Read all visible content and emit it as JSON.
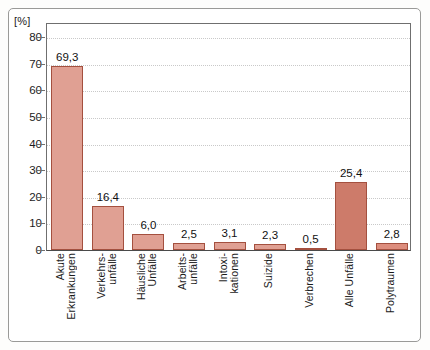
{
  "figure": {
    "y_unit_label": "[%]"
  },
  "chart_data": {
    "type": "bar",
    "title": "",
    "xlabel": "",
    "ylabel": "[%]",
    "ylim": [
      0,
      85
    ],
    "yticks": [
      0,
      10,
      20,
      30,
      40,
      50,
      60,
      70,
      80
    ],
    "ytick_labels": [
      "0",
      "10",
      "20",
      "30",
      "40",
      "50",
      "60",
      "70",
      "80"
    ],
    "grid": "horizontal-dotted",
    "legend": "none",
    "categories": [
      "Akute Erkrankungen",
      "Verkehrs-unfälle",
      "Häusliche Unfälle",
      "Arbeits-unfälle",
      "Intoxi-kationen",
      "Suizide",
      "Verbrechen",
      "Alle Unfälle",
      "Polytraumen"
    ],
    "category_lines": [
      [
        "Akute",
        "Erkrankungen"
      ],
      [
        "Verkehrs-",
        "unfälle"
      ],
      [
        "Häusliche",
        "Unfälle"
      ],
      [
        "Arbeits-",
        "unfälle"
      ],
      [
        "Intoxi-",
        "kationen"
      ],
      [
        "Suizide"
      ],
      [
        "Verbrechen"
      ],
      [
        "Alle Unfälle"
      ],
      [
        "Polytraumen"
      ]
    ],
    "values": [
      69.3,
      16.4,
      6.0,
      2.5,
      3.1,
      2.3,
      0.5,
      25.4,
      2.8
    ],
    "value_labels": [
      "69,3",
      "16,4",
      "6,0",
      "2,5",
      "3,1",
      "2,3",
      "0,5",
      "25,4",
      "2,8"
    ],
    "bar_colors": [
      "#e0a093",
      "#e0a093",
      "#e0a093",
      "#e0a093",
      "#e0a093",
      "#e0a093",
      "#e0a093",
      "#cd7b6a",
      "#dd8d7d"
    ],
    "bar_border_color": "#a4503f",
    "gridline_color": "#c9c9c9",
    "axis_color": "#6f6f6f",
    "frame_color": "#9a9a98",
    "text_color": "#1a1a1a"
  }
}
